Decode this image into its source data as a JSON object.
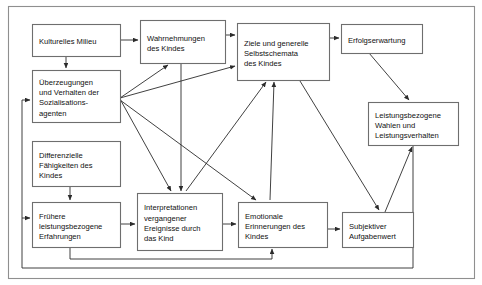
{
  "diagram": {
    "frame": {
      "x": 8,
      "y": 6,
      "width": 466,
      "height": 272
    },
    "colors": {
      "background": "#ffffff",
      "node_fill": "#ffffff",
      "node_border": "#6e6e6e",
      "frame_border": "#8f8f8f",
      "edge": "#2b2b2b",
      "text": "#111111"
    },
    "nodes": [
      {
        "id": "kulturelles-milieu",
        "name": "kulturelles-milieu",
        "lines": [
          "Kulturelles Milieu"
        ],
        "x": 32,
        "y": 24,
        "width": 88,
        "height": 32
      },
      {
        "id": "ueberzeugungen",
        "name": "ueberzeugungen-sozialisationsagenten",
        "lines": [
          "Überzeugungen",
          "und Verhalten der",
          "Sozialisations-",
          "agenten"
        ],
        "x": 32,
        "y": 70,
        "width": 88,
        "height": 52
      },
      {
        "id": "differenzielle-faehigkeiten",
        "name": "differenzielle-faehigkeiten-des-kindes",
        "lines": [
          "Differenzielle",
          "Fähigkeiten des",
          "Kindes"
        ],
        "x": 32,
        "y": 141,
        "width": 88,
        "height": 45
      },
      {
        "id": "fruehere-erfahrungen",
        "name": "fruehere-leistungsbezogene-erfahrungen",
        "lines": [
          "Frühere",
          "leistungsbezogene",
          "Erfahrungen"
        ],
        "x": 32,
        "y": 202,
        "width": 88,
        "height": 45
      },
      {
        "id": "wahrnehmungen",
        "name": "wahrnehmungen-des-kindes",
        "lines": [
          "Wahrnehmungen",
          "des Kindes"
        ],
        "x": 140,
        "y": 20,
        "width": 85,
        "height": 43
      },
      {
        "id": "interpretationen",
        "name": "interpretationen-vergangener-ereignisse",
        "lines": [
          "Interpretationen",
          "vergangener",
          "Ereignisse durch",
          "das Kind"
        ],
        "x": 137,
        "y": 193,
        "width": 85,
        "height": 57
      },
      {
        "id": "ziele-selbstschemata",
        "name": "ziele-und-generelle-selbstschemata",
        "lines": [
          "Ziele und generelle",
          "Selbstschemata",
          "des Kindes"
        ],
        "x": 237,
        "y": 23,
        "width": 92,
        "height": 57
      },
      {
        "id": "emotionale-erinnerungen",
        "name": "emotionale-erinnerungen-des-kindes",
        "lines": [
          "Emotionale",
          "Erinnerungen des",
          "Kindes"
        ],
        "x": 238,
        "y": 202,
        "width": 89,
        "height": 45
      },
      {
        "id": "erfolgserwartung",
        "name": "erfolgserwartung",
        "lines": [
          "Erfolgserwartung"
        ],
        "x": 341,
        "y": 24,
        "width": 81,
        "height": 29
      },
      {
        "id": "leistungsbezogene-wahlen",
        "name": "leistungsbezogene-wahlen-und-verhalten",
        "lines": [
          "Leistungsbezogene",
          "Wahlen und",
          "Leistungsverhalten"
        ],
        "x": 368,
        "y": 102,
        "width": 90,
        "height": 43
      },
      {
        "id": "subjektiver-aufgabenwert",
        "name": "subjektiver-aufgabenwert",
        "lines": [
          "Subjektiver",
          "Aufgabenwert"
        ],
        "x": 342,
        "y": 212,
        "width": 71,
        "height": 35
      }
    ],
    "edges": [
      {
        "name": "edge-kulturelles-to-wahrnehmungen",
        "from": "kulturelles-milieu",
        "to": "wahrnehmungen",
        "points": "120,40 138,40"
      },
      {
        "name": "edge-kulturelles-to-ueberzeugungen",
        "from": "kulturelles-milieu",
        "to": "ueberzeugungen",
        "points": "66,56 66,68"
      },
      {
        "name": "edge-ueberzeugungen-to-wahrnehmungen",
        "from": "ueberzeugungen",
        "to": "wahrnehmungen",
        "points": "120,98 168,65"
      },
      {
        "name": "edge-ueberzeugungen-to-ziele",
        "from": "ueberzeugungen",
        "to": "ziele-selbstschemata",
        "points": "120,98 235,66"
      },
      {
        "name": "edge-ueberzeugungen-to-interpretationen",
        "from": "ueberzeugungen",
        "to": "interpretationen",
        "points": "120,99 171,191"
      },
      {
        "name": "edge-ueberzeugungen-to-emotionale",
        "from": "ueberzeugungen",
        "to": "emotionale-erinnerungen",
        "points": "120,100 256,200"
      },
      {
        "name": "edge-differenzielle-to-fruehere",
        "from": "differenzielle-faehigkeiten",
        "to": "fruehere-erfahrungen",
        "points": "70,186 70,200"
      },
      {
        "name": "edge-fruehere-to-interpretationen",
        "from": "fruehere-erfahrungen",
        "to": "interpretationen",
        "points": "120,224 135,224"
      },
      {
        "name": "edge-interpretationen-to-emotionale",
        "from": "interpretationen",
        "to": "emotionale-erinnerungen",
        "points": "222,224 236,224"
      },
      {
        "name": "edge-emotionale-to-subjektiver",
        "from": "emotionale-erinnerungen",
        "to": "subjektiver-aufgabenwert",
        "points": "327,229 340,229"
      },
      {
        "name": "edge-ziele-to-erfolgserwartung",
        "from": "ziele-selbstschemata",
        "to": "erfolgserwartung",
        "points": "329,38 339,38"
      },
      {
        "name": "edge-wahrnehmungen-to-ziele",
        "from": "wahrnehmungen",
        "to": "ziele-selbstschemata",
        "points": "225,35 235,35"
      },
      {
        "name": "edge-interpretationen-to-ziele",
        "from": "interpretationen",
        "to": "ziele-selbstschemata",
        "points": "186,191 266,82"
      },
      {
        "name": "edge-emotionale-to-ziele",
        "from": "emotionale-erinnerungen",
        "to": "ziele-selbstschemata",
        "points": "270,200 274,82"
      },
      {
        "name": "edge-wahrnehmungen-to-interpretationen",
        "from": "wahrnehmungen",
        "to": "interpretationen",
        "points": "181,63 181,191"
      },
      {
        "name": "edge-erfolgserwartung-to-leistungsbezogene",
        "from": "erfolgserwartung",
        "to": "leistungsbezogene-wahlen",
        "points": "369,53 409,100"
      },
      {
        "name": "edge-ziele-to-subjektiver",
        "from": "ziele-selbstschemata",
        "to": "subjektiver-aufgabenwert",
        "points": "300,81 379,210"
      },
      {
        "name": "edge-subjektiver-to-leistungsbezogene",
        "from": "subjektiver-aufgabenwert",
        "to": "leistungsbezogene-wahlen",
        "points": "385,212 412,147"
      },
      {
        "name": "edge-feedback-fruehere-to-emotionale",
        "from": "fruehere-erfahrungen",
        "to": "emotionale-erinnerungen",
        "points": "70,247 70,259 272,259 272,249"
      },
      {
        "name": "edge-feedback-leistungsbezogene-to-ueberzeugungen",
        "from": "leistungsbezogene-wahlen",
        "to": "ueberzeugungen",
        "points": "413,145 413,268 22,268 22,100 30,100"
      },
      {
        "name": "edge-feedback-loop-to-fruehere",
        "from": "leistungsbezogene-wahlen",
        "to": "fruehere-erfahrungen",
        "points": "22,218 30,218"
      }
    ]
  }
}
